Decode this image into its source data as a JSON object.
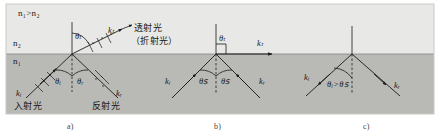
{
  "figure": {
    "title_note": "",
    "frame": {
      "x": 6,
      "y": 4,
      "width": 428,
      "height": 110
    },
    "interface_y": 54,
    "colors": {
      "upper_medium": "#e8e8e6",
      "lower_medium": "#b9b9b6",
      "frame_border": "#c9c9c6",
      "ray": "#1a1a1a",
      "text": "#1a1a1a",
      "caption": "#444444"
    }
  },
  "panels": [
    {
      "id": "a",
      "caption": "a)",
      "condition_label": "n₁>n₂",
      "medium_upper_label": "n₂",
      "medium_lower_label": "n₁",
      "angles": [
        {
          "name": "theta-t",
          "label": "θₜ"
        },
        {
          "name": "theta-i",
          "label": "θᵢ"
        },
        {
          "name": "theta-r",
          "label": "θᵣ"
        }
      ],
      "vectors": [
        {
          "name": "k-i",
          "label": "kᵢ"
        },
        {
          "name": "k-t",
          "label": "kₜ"
        },
        {
          "name": "k-r",
          "label": "kᵣ"
        }
      ],
      "ray_labels": [
        {
          "name": "transmitted-light",
          "label": "透射光"
        },
        {
          "name": "refracted-light",
          "label": "（折射光）"
        },
        {
          "name": "incident-light",
          "label": "入射光"
        },
        {
          "name": "reflected-light",
          "label": "反射光"
        }
      ]
    },
    {
      "id": "b",
      "caption": "b)",
      "angles": [
        {
          "name": "theta-t",
          "label": "θₜ"
        },
        {
          "name": "theta-c-left",
          "label": "θꜱ"
        },
        {
          "name": "theta-c-right",
          "label": "θꜱ"
        }
      ],
      "vectors": [
        {
          "name": "k-i",
          "label": "kᵢ"
        },
        {
          "name": "k-t",
          "label": "kₜ"
        },
        {
          "name": "k-r",
          "label": "kᵣ"
        }
      ],
      "right_angle_marker": true
    },
    {
      "id": "c",
      "caption": "c)",
      "angles": [
        {
          "name": "theta-condition",
          "label": "θᵢ>θꜱ"
        }
      ],
      "vectors": [
        {
          "name": "k-i",
          "label": "kᵢ"
        },
        {
          "name": "k-r",
          "label": "kᵣ"
        }
      ]
    }
  ]
}
